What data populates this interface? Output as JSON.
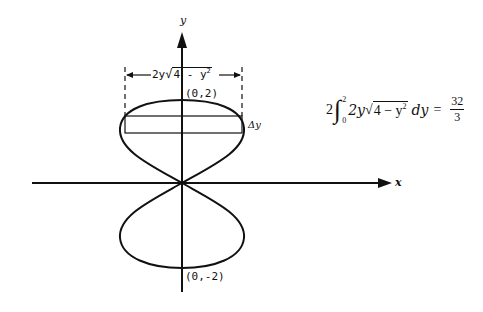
{
  "diagram": {
    "axes": {
      "x_label": "x",
      "y_label": "y"
    },
    "points": {
      "top": "(0,2)",
      "bottom": "(0,-2)"
    },
    "width_label": {
      "prefix": "2y",
      "radicand": "4 - y",
      "exp": "2"
    },
    "strip_label": "Δy",
    "formula": {
      "coef": "2",
      "upper": "2",
      "lower": "0",
      "integrand_prefix": "2y",
      "radicand": "4 − y",
      "exp": "2",
      "dvar": "dy",
      "equals": "=",
      "numerator": "32",
      "denominator": "3"
    },
    "colors": {
      "ink": "#111111",
      "background": "#ffffff"
    }
  }
}
